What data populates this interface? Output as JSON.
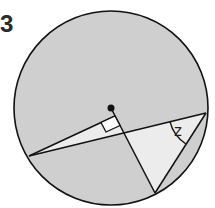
{
  "question_number": "3",
  "diagram": {
    "circle": {
      "cx": 111,
      "cy": 108,
      "r": 97,
      "fill": "#cfcfcf",
      "stroke": "#111111"
    },
    "center_dot": {
      "x": 111,
      "y": 108
    },
    "points": {
      "A": [
        29,
        156
      ],
      "B": [
        155,
        193
      ],
      "C": [
        206,
        113
      ],
      "F": [
        115,
        116
      ],
      "X": [
        124,
        133
      ]
    },
    "angle_label": "z",
    "right_angle_marker": true,
    "highlight_fill": "#ececec"
  }
}
